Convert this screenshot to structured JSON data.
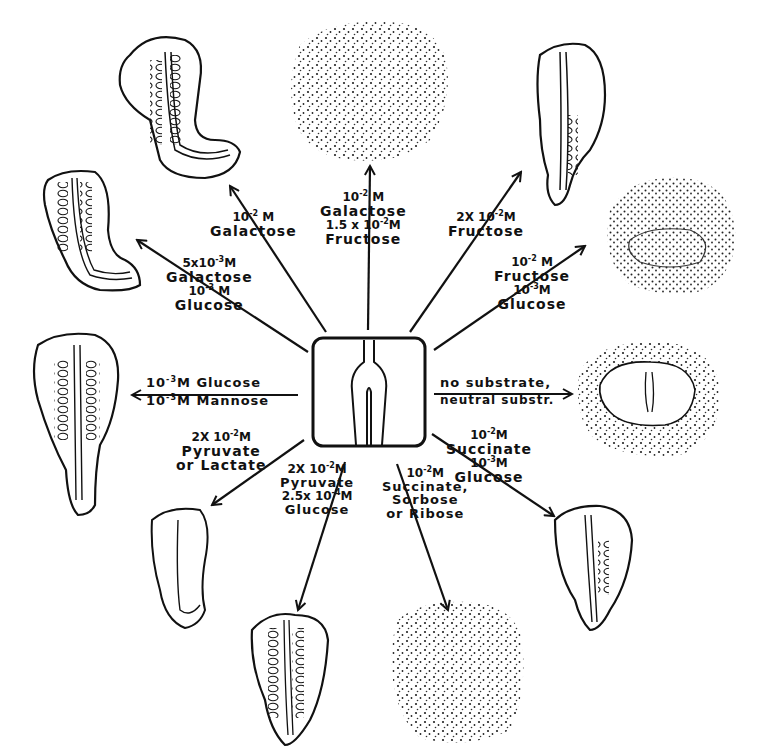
{
  "diagram": {
    "center": {
      "label": "explant-center",
      "description": "square tissue explant with neural groove"
    },
    "branches": [
      {
        "id": "galactose-1e-2",
        "lines": [
          "10-2 M",
          "Galactose"
        ],
        "result": "elongated curved embryo"
      },
      {
        "id": "galactose-fructose",
        "lines": [
          "10-2 M",
          "Galactose",
          "+",
          "1.5 x 10-2 M",
          "Fructose"
        ],
        "result": "dispersed stippled cells"
      },
      {
        "id": "fructose-2e-2",
        "lines": [
          "2 X 10-2 M",
          "Fructose"
        ],
        "result": "elongated embryo"
      },
      {
        "id": "fructose-glucose",
        "lines": [
          "10-2 M",
          "Fructose",
          "+",
          "10-3 M",
          "Glucose"
        ],
        "result": "dispersed stippled cells with ring"
      },
      {
        "id": "no-substrate",
        "lines": [
          "no substrate,",
          "neutral substr."
        ],
        "result": "disorganized mass"
      },
      {
        "id": "succinate-glucose",
        "lines": [
          "10-2 M",
          "Succinate",
          "+",
          "10-3 M",
          "Glucose"
        ],
        "result": "short embryo"
      },
      {
        "id": "succinate-sorbose-ribose",
        "lines": [
          "10-2 M",
          "Succinate,",
          "Sorbose",
          "or Ribose"
        ],
        "result": "dispersed stippled cells"
      },
      {
        "id": "pyruvate-glucose",
        "lines": [
          "2 X 10-2 M",
          "Pyruvate",
          "+",
          "2.5 x 10-4 M",
          "Glucose"
        ],
        "result": "embryo"
      },
      {
        "id": "pyruvate-lactate",
        "lines": [
          "2 X 10-2 M",
          "Pyruvate",
          "or Lactate"
        ],
        "result": "small curved embryo"
      },
      {
        "id": "glucose-mannose",
        "lines": [
          "10-3 M Glucose",
          "10-3 M Mannose"
        ],
        "result": "full embryo"
      },
      {
        "id": "galactose-glucose",
        "lines": [
          "5 x 10-3 M",
          "Galactose",
          "+",
          "10-3 M",
          "Glucose"
        ],
        "result": "curved embryo"
      }
    ]
  },
  "labels": {
    "gal2": {
      "conc": "10",
      "exp": "-2",
      "unit": " M",
      "sub": "Galactose"
    },
    "galfru": {
      "conc1": "10",
      "exp1": "-2",
      "unit1": " M",
      "sub1": "Galactose",
      "plus": "+",
      "conc2": "1.5 x 10",
      "exp2": "-2",
      "unit2": "M",
      "sub2": "Fructose"
    },
    "fru2": {
      "conc": "2X 10",
      "exp": "-2",
      "unit": "M",
      "sub": "Fructose"
    },
    "frugl": {
      "conc1": "10",
      "exp1": "-2",
      "unit1": " M",
      "sub1": "Fructose",
      "plus": "+",
      "conc2": "10",
      "exp2": "-3",
      "unit2": "M",
      "sub2": "Glucose"
    },
    "nosub": {
      "l1": "no substrate,",
      "l2": "neutral substr."
    },
    "sucgl": {
      "conc1": "10",
      "exp1": "-2",
      "unit1": "M",
      "sub1": "Succinate",
      "plus": "+",
      "conc2": "10",
      "exp2": "-3",
      "unit2": "M",
      "sub2": "Glucose"
    },
    "sucsor": {
      "conc": "10",
      "exp": "-2",
      "unit": "M",
      "l1": "Succinate,",
      "l2": "Sorbose",
      "l3": "or Ribose"
    },
    "pyrgl": {
      "conc1": "2X 10",
      "exp1": "-2",
      "unit1": "M",
      "sub1": "Pyruvate",
      "plus": "+",
      "conc2": "2.5x 10",
      "exp2": "-4",
      "unit2": "M",
      "sub2": "Glucose"
    },
    "pyrlac": {
      "conc": "2X 10",
      "exp": "-2",
      "unit": "M",
      "l1": "Pyruvate",
      "l2": "or Lactate"
    },
    "glman": {
      "c1": "10",
      "e1": "-3",
      "t1": "M Glucose",
      "c2": "10",
      "e2": "-3",
      "t2": "M Mannose"
    },
    "galgl": {
      "conc1": "5x10",
      "exp1": "-3",
      "unit1": "M",
      "sub1": "Galactose",
      "plus": "+",
      "conc2": "10",
      "exp2": "-3",
      "unit2": " M",
      "sub2": "Glucose"
    }
  },
  "colors": {
    "ink": "#111111",
    "paper": "#ffffff"
  }
}
